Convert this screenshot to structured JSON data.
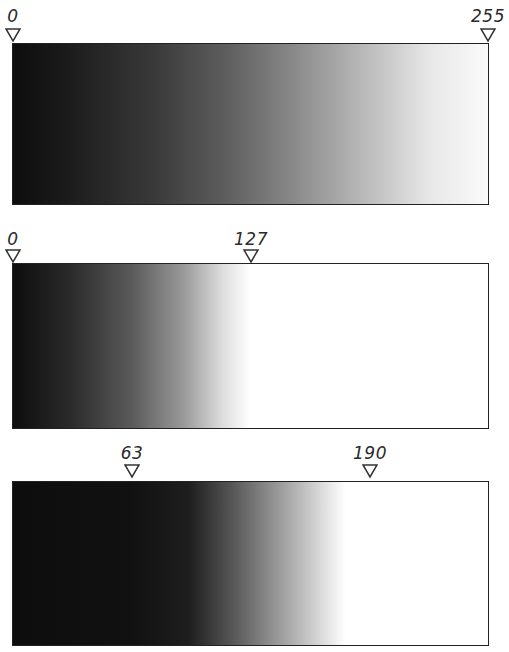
{
  "panels": [
    {
      "name": "full-range",
      "markers": [
        {
          "label": "0",
          "value": 0
        },
        {
          "label": "255",
          "value": 255
        }
      ],
      "gradient": {
        "black_point": 0,
        "white_point": 255
      }
    },
    {
      "name": "white-point-127",
      "markers": [
        {
          "label": "0",
          "value": 0
        },
        {
          "label": "127",
          "value": 127
        }
      ],
      "gradient": {
        "black_point": 0,
        "white_point": 127
      }
    },
    {
      "name": "range-63-190",
      "markers": [
        {
          "label": "63",
          "value": 63
        },
        {
          "label": "190",
          "value": 190
        }
      ],
      "gradient": {
        "black_point": 63,
        "white_point": 190
      }
    }
  ],
  "colors": {
    "dark": "#111111",
    "light": "#ffffff",
    "stroke": "#222222"
  }
}
